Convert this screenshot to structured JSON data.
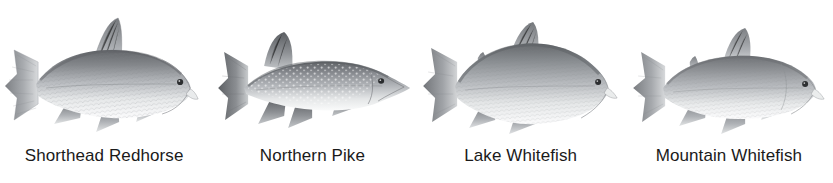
{
  "figure": {
    "background_color": "#ffffff",
    "label_color": "#1a1a1a",
    "art_style": "grayscale scientific illustration"
  },
  "species": [
    {
      "label": "Shorthead Redhorse",
      "icon": "fish-shorthead-redhorse-illustration",
      "facing": "right",
      "body_shape": "deep-bodied sucker with tall falcate dorsal fin",
      "tone_dark": "#6f7276",
      "tone_mid": "#a9acb0",
      "tone_light": "#f2f3f4"
    },
    {
      "label": "Northern Pike",
      "icon": "fish-northern-pike-illustration",
      "facing": "right",
      "body_shape": "elongate torpedo body, duck-bill snout, rear-set dorsal fin, light spots",
      "tone_dark": "#6a6d71",
      "tone_mid": "#a5a8ac",
      "tone_light": "#f1f2f3"
    },
    {
      "label": "Lake Whitefish",
      "icon": "fish-lake-whitefish-illustration",
      "facing": "right",
      "body_shape": "deep humped back, small head, adipose fin",
      "tone_dark": "#73767a",
      "tone_mid": "#abaeb2",
      "tone_light": "#f3f4f5"
    },
    {
      "label": "Mountain Whitefish",
      "icon": "fish-mountain-whitefish-illustration",
      "facing": "right",
      "body_shape": "slender cylindrical body, small mouth, adipose fin",
      "tone_dark": "#7a7d81",
      "tone_mid": "#b0b3b7",
      "tone_light": "#f4f5f6"
    }
  ]
}
